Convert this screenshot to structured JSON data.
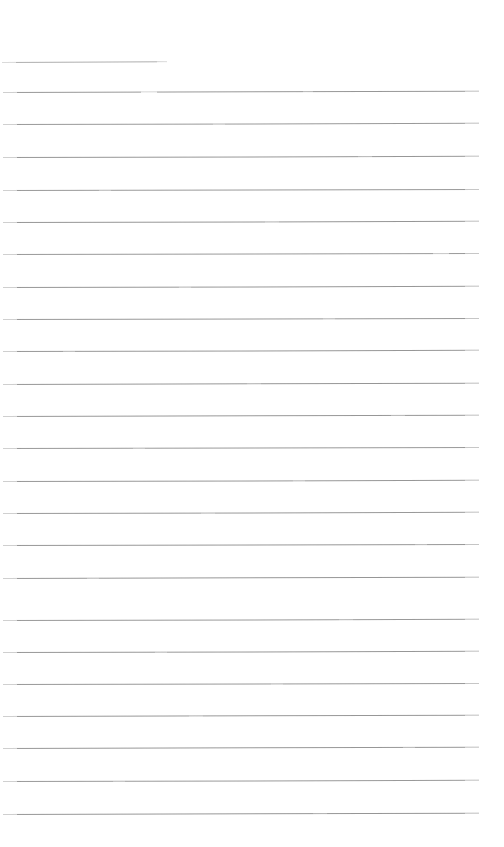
{
  "document": {
    "kind": "scanned-ruled-page",
    "title": "Blank ruled notebook page",
    "page_width": 504,
    "page_height": 847,
    "background_color": "#ffffff",
    "has_text": false,
    "text_content": "",
    "rule_count": 24,
    "rule_spacing": 32.3,
    "rule_color": "#8f8f8f",
    "rule_thickness": 1,
    "left_margin": 3,
    "right_margin": 479,
    "heading_rule_note": "first rule is short, underline style"
  },
  "rules": [
    {
      "index": 1,
      "y": 62,
      "x": 2,
      "width": 165,
      "color": "#9a9a9a",
      "opacity": 0.8,
      "tilt": -0.22,
      "short": true,
      "dropouts": []
    },
    {
      "index": 2,
      "y": 92,
      "x": 3,
      "width": 476,
      "color": "#8f8f8f",
      "opacity": 0.92,
      "tilt": -0.16,
      "short": false,
      "dropouts": [
        {
          "x": 138,
          "width": 16,
          "opacity": 0.75
        },
        {
          "x": 300,
          "width": 10,
          "opacity": 0.35
        }
      ]
    },
    {
      "index": 3,
      "y": 124,
      "x": 3,
      "width": 476,
      "color": "#8f8f8f",
      "opacity": 0.9,
      "tilt": -0.14,
      "short": false,
      "dropouts": [
        {
          "x": 210,
          "width": 12,
          "opacity": 0.3
        }
      ]
    },
    {
      "index": 4,
      "y": 157,
      "x": 3,
      "width": 476,
      "color": "#8f8f8f",
      "opacity": 0.92,
      "tilt": -0.14,
      "short": false,
      "dropouts": [
        {
          "x": 355,
          "width": 14,
          "opacity": 0.3
        }
      ]
    },
    {
      "index": 5,
      "y": 190,
      "x": 3,
      "width": 476,
      "color": "#8f8f8f",
      "opacity": 0.9,
      "tilt": -0.12,
      "short": false,
      "dropouts": [
        {
          "x": 96,
          "width": 12,
          "opacity": 0.3
        }
      ]
    },
    {
      "index": 6,
      "y": 222,
      "x": 3,
      "width": 476,
      "color": "#8f8f8f",
      "opacity": 0.93,
      "tilt": -0.14,
      "short": false,
      "dropouts": [
        {
          "x": 262,
          "width": 14,
          "opacity": 0.28
        }
      ]
    },
    {
      "index": 7,
      "y": 254,
      "x": 3,
      "width": 476,
      "color": "#8f8f8f",
      "opacity": 0.9,
      "tilt": -0.12,
      "short": false,
      "dropouts": [
        {
          "x": 430,
          "width": 16,
          "opacity": 0.45
        }
      ]
    },
    {
      "index": 8,
      "y": 287,
      "x": 3,
      "width": 476,
      "color": "#8f8f8f",
      "opacity": 0.92,
      "tilt": -0.14,
      "short": false,
      "dropouts": [
        {
          "x": 176,
          "width": 12,
          "opacity": 0.3
        }
      ]
    },
    {
      "index": 9,
      "y": 319,
      "x": 3,
      "width": 476,
      "color": "#8f8f8f",
      "opacity": 0.91,
      "tilt": -0.12,
      "short": false,
      "dropouts": [
        {
          "x": 320,
          "width": 12,
          "opacity": 0.28
        }
      ]
    },
    {
      "index": 10,
      "y": 351,
      "x": 3,
      "width": 476,
      "color": "#8f8f8f",
      "opacity": 0.92,
      "tilt": -0.14,
      "short": false,
      "dropouts": [
        {
          "x": 60,
          "width": 12,
          "opacity": 0.3
        }
      ]
    },
    {
      "index": 11,
      "y": 384,
      "x": 3,
      "width": 476,
      "color": "#8f8f8f",
      "opacity": 0.93,
      "tilt": -0.16,
      "short": false,
      "dropouts": [
        {
          "x": 244,
          "width": 14,
          "opacity": 0.25
        }
      ]
    },
    {
      "index": 12,
      "y": 416,
      "x": 3,
      "width": 476,
      "color": "#8f8f8f",
      "opacity": 0.92,
      "tilt": -0.16,
      "short": false,
      "dropouts": [
        {
          "x": 388,
          "width": 14,
          "opacity": 0.3
        }
      ]
    },
    {
      "index": 13,
      "y": 448,
      "x": 3,
      "width": 476,
      "color": "#8f8f8f",
      "opacity": 0.9,
      "tilt": -0.12,
      "short": false,
      "dropouts": [
        {
          "x": 130,
          "width": 12,
          "opacity": 0.28
        }
      ]
    },
    {
      "index": 14,
      "y": 481,
      "x": 3,
      "width": 476,
      "color": "#8f8f8f",
      "opacity": 0.92,
      "tilt": -0.14,
      "short": false,
      "dropouts": [
        {
          "x": 290,
          "width": 12,
          "opacity": 0.3
        }
      ]
    },
    {
      "index": 15,
      "y": 513,
      "x": 3,
      "width": 476,
      "color": "#8f8f8f",
      "opacity": 0.91,
      "tilt": -0.14,
      "short": false,
      "dropouts": [
        {
          "x": 198,
          "width": 14,
          "opacity": 0.28
        }
      ]
    },
    {
      "index": 16,
      "y": 545,
      "x": 3,
      "width": 476,
      "color": "#8f8f8f",
      "opacity": 0.92,
      "tilt": -0.12,
      "short": false,
      "dropouts": [
        {
          "x": 412,
          "width": 12,
          "opacity": 0.3
        }
      ]
    },
    {
      "index": 17,
      "y": 578,
      "x": 3,
      "width": 476,
      "color": "#8f8f8f",
      "opacity": 0.93,
      "tilt": -0.16,
      "short": false,
      "dropouts": [
        {
          "x": 84,
          "width": 12,
          "opacity": 0.3
        }
      ]
    },
    {
      "index": 18,
      "y": 620,
      "x": 3,
      "width": 476,
      "color": "#8f8f8f",
      "opacity": 0.9,
      "tilt": -0.14,
      "short": false,
      "dropouts": [
        {
          "x": 336,
          "width": 14,
          "opacity": 0.28
        }
      ]
    },
    {
      "index": 19,
      "y": 652,
      "x": 3,
      "width": 476,
      "color": "#8f8f8f",
      "opacity": 0.92,
      "tilt": -0.14,
      "short": false,
      "dropouts": [
        {
          "x": 152,
          "width": 12,
          "opacity": 0.3
        }
      ]
    },
    {
      "index": 20,
      "y": 684,
      "x": 3,
      "width": 476,
      "color": "#8f8f8f",
      "opacity": 0.91,
      "tilt": -0.12,
      "short": false,
      "dropouts": [
        {
          "x": 268,
          "width": 12,
          "opacity": 0.28
        }
      ]
    },
    {
      "index": 21,
      "y": 716,
      "x": 3,
      "width": 476,
      "color": "#8f8f8f",
      "opacity": 0.92,
      "tilt": -0.16,
      "short": false,
      "dropouts": [
        {
          "x": 186,
          "width": 14,
          "opacity": 0.3
        }
      ]
    },
    {
      "index": 22,
      "y": 748,
      "x": 3,
      "width": 476,
      "color": "#8f8f8f",
      "opacity": 0.92,
      "tilt": -0.16,
      "short": false,
      "dropouts": [
        {
          "x": 400,
          "width": 12,
          "opacity": 0.3
        }
      ]
    },
    {
      "index": 23,
      "y": 781,
      "x": 3,
      "width": 476,
      "color": "#8f8f8f",
      "opacity": 0.9,
      "tilt": -0.14,
      "short": false,
      "dropouts": [
        {
          "x": 110,
          "width": 12,
          "opacity": 0.28
        }
      ]
    },
    {
      "index": 24,
      "y": 814,
      "x": 3,
      "width": 476,
      "color": "#8f8f8f",
      "opacity": 0.93,
      "tilt": -0.16,
      "short": false,
      "dropouts": [
        {
          "x": 310,
          "width": 14,
          "opacity": 0.25
        }
      ]
    }
  ]
}
